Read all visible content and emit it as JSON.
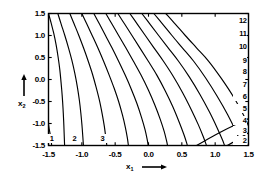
{
  "figure": {
    "background_color": "#ffffff",
    "line_color": "#000000",
    "frame_color": "#000000"
  },
  "axes": {
    "x": {
      "title": "x",
      "title_subscript": "1",
      "title_arrow": "⟶",
      "min": -1.5,
      "max": 1.5,
      "ticks": [
        -1.5,
        -1.0,
        -0.5,
        0.0,
        0.5,
        1.0,
        1.5
      ],
      "tick_labels": [
        "-1.5",
        "-1.0",
        "-0.5",
        "0.0",
        "0.5",
        "1.0",
        "1.5"
      ]
    },
    "y": {
      "title": "x",
      "title_subscript": "2",
      "title_arrow": "↑",
      "min": -1.5,
      "max": 1.5,
      "ticks": [
        -1.5,
        -1.0,
        -0.5,
        0.0,
        0.5,
        1.0,
        1.5
      ],
      "tick_labels": [
        "-1.5",
        "-1.0",
        "-0.5",
        "0.0",
        "0.5",
        "1.0",
        "1.5"
      ]
    }
  },
  "chart_data": {
    "type": "line",
    "plot_kind": "contour",
    "title": "",
    "xlabel": "x1",
    "ylabel": "x2",
    "xlim": [
      -1.5,
      1.5
    ],
    "ylim": [
      -1.5,
      1.5
    ],
    "grid": false,
    "legend": "none",
    "levels": [
      1,
      2,
      3,
      4,
      5,
      6,
      7,
      8,
      9,
      10,
      11,
      12
    ],
    "level_labels_right_edge": [
      "12",
      "11",
      "10",
      "9",
      "8",
      "7",
      "6",
      "5",
      "4",
      "3",
      "2"
    ],
    "level_labels_bottom_edge": [
      "1",
      "2",
      "3"
    ],
    "right_edge_label_y_values": [
      1.32,
      1.04,
      0.74,
      0.43,
      0.16,
      -0.12,
      -0.4,
      -0.68,
      -0.94,
      -1.18,
      -1.4
    ],
    "bottom_edge_label_x_values": [
      -1.46,
      -1.12,
      -0.7
    ],
    "contours": [
      {
        "level": 1,
        "label": "1",
        "points": [
          [
            -1.5,
            -1.02
          ],
          [
            -1.49,
            -1.12
          ],
          [
            -1.475,
            -1.24
          ],
          [
            -1.462,
            -1.36
          ],
          [
            -1.455,
            -1.46
          ],
          [
            -1.452,
            -1.5
          ]
        ]
      },
      {
        "level": 2,
        "label": "2",
        "points": [
          [
            -1.5,
            1.5
          ],
          [
            -1.46,
            1.28
          ],
          [
            -1.42,
            1.04
          ],
          [
            -1.385,
            0.78
          ],
          [
            -1.355,
            0.5
          ],
          [
            -1.33,
            0.22
          ],
          [
            -1.312,
            -0.06
          ],
          [
            -1.295,
            -0.36
          ],
          [
            -1.282,
            -0.66
          ],
          [
            -1.272,
            -0.96
          ],
          [
            -1.265,
            -1.24
          ],
          [
            -1.26,
            -1.44
          ],
          [
            -1.258,
            -1.5
          ]
        ]
      },
      {
        "level": 3,
        "label": "3",
        "points": [
          [
            -1.36,
            1.5
          ],
          [
            -1.31,
            1.26
          ],
          [
            -1.255,
            1.0
          ],
          [
            -1.2,
            0.72
          ],
          [
            -1.15,
            0.44
          ],
          [
            -1.105,
            0.14
          ],
          [
            -1.068,
            -0.16
          ],
          [
            -1.038,
            -0.46
          ],
          [
            -1.015,
            -0.76
          ],
          [
            -0.998,
            -1.04
          ],
          [
            -0.985,
            -1.3
          ],
          [
            -0.978,
            -1.46
          ],
          [
            -0.976,
            -1.5
          ]
        ]
      },
      {
        "level": 4,
        "label": "4",
        "points": [
          [
            -1.18,
            1.5
          ],
          [
            -1.115,
            1.26
          ],
          [
            -1.045,
            1.0
          ],
          [
            -0.975,
            0.72
          ],
          [
            -0.905,
            0.42
          ],
          [
            -0.84,
            0.12
          ],
          [
            -0.785,
            -0.18
          ],
          [
            -0.735,
            -0.48
          ],
          [
            -0.695,
            -0.78
          ],
          [
            -0.663,
            -1.06
          ],
          [
            -0.64,
            -1.32
          ],
          [
            -0.628,
            -1.46
          ],
          [
            -0.625,
            -1.5
          ]
        ]
      },
      {
        "level": 5,
        "label": "5",
        "points": [
          [
            -1.0,
            1.5
          ],
          [
            -0.925,
            1.26
          ],
          [
            -0.845,
            1.0
          ],
          [
            -0.76,
            0.72
          ],
          [
            -0.675,
            0.42
          ],
          [
            -0.59,
            0.1
          ],
          [
            -0.515,
            -0.2
          ],
          [
            -0.448,
            -0.5
          ],
          [
            -0.392,
            -0.8
          ],
          [
            -0.348,
            -1.08
          ],
          [
            -0.318,
            -1.32
          ],
          [
            -0.305,
            -1.46
          ],
          [
            -0.302,
            -1.5
          ]
        ]
      },
      {
        "level": 6,
        "label": "6",
        "points": [
          [
            -0.82,
            1.5
          ],
          [
            -0.735,
            1.26
          ],
          [
            -0.645,
            1.0
          ],
          [
            -0.548,
            0.72
          ],
          [
            -0.45,
            0.42
          ],
          [
            -0.35,
            0.1
          ],
          [
            -0.258,
            -0.22
          ],
          [
            -0.175,
            -0.54
          ],
          [
            -0.105,
            -0.86
          ],
          [
            -0.052,
            -1.14
          ],
          [
            -0.02,
            -1.36
          ],
          [
            -0.008,
            -1.47
          ],
          [
            -0.005,
            -1.5
          ]
        ]
      },
      {
        "level": 7,
        "label": "7",
        "points": [
          [
            -0.64,
            1.5
          ],
          [
            -0.548,
            1.26
          ],
          [
            -0.448,
            1.0
          ],
          [
            -0.34,
            0.72
          ],
          [
            -0.228,
            0.42
          ],
          [
            -0.112,
            0.1
          ],
          [
            -0.002,
            -0.24
          ],
          [
            0.095,
            -0.58
          ],
          [
            0.175,
            -0.9
          ],
          [
            0.235,
            -1.18
          ],
          [
            0.272,
            -1.4
          ],
          [
            0.285,
            -1.5
          ]
        ]
      },
      {
        "level": 8,
        "label": "8",
        "points": [
          [
            -0.46,
            1.5
          ],
          [
            -0.358,
            1.26
          ],
          [
            -0.248,
            1.0
          ],
          [
            -0.13,
            0.72
          ],
          [
            -0.005,
            0.42
          ],
          [
            0.125,
            0.1
          ],
          [
            0.252,
            -0.26
          ],
          [
            0.365,
            -0.62
          ],
          [
            0.458,
            -0.96
          ],
          [
            0.528,
            -1.24
          ],
          [
            0.572,
            -1.44
          ],
          [
            0.582,
            -1.5
          ]
        ]
      },
      {
        "level": 9,
        "label": "9",
        "points": [
          [
            -0.28,
            1.5
          ],
          [
            -0.168,
            1.26
          ],
          [
            -0.048,
            1.0
          ],
          [
            0.082,
            0.72
          ],
          [
            0.222,
            0.42
          ],
          [
            0.368,
            0.08
          ],
          [
            0.512,
            -0.3
          ],
          [
            0.64,
            -0.68
          ],
          [
            0.745,
            -1.02
          ],
          [
            0.822,
            -1.3
          ],
          [
            0.865,
            -1.48
          ],
          [
            0.87,
            -1.5
          ]
        ]
      },
      {
        "level": 10,
        "label": "10",
        "points": [
          [
            -0.1,
            1.5
          ],
          [
            0.022,
            1.26
          ],
          [
            0.152,
            1.0
          ],
          [
            0.295,
            0.72
          ],
          [
            0.448,
            0.42
          ],
          [
            0.612,
            0.06
          ],
          [
            0.772,
            -0.34
          ],
          [
            0.915,
            -0.74
          ],
          [
            1.03,
            -1.1
          ],
          [
            1.112,
            -1.38
          ],
          [
            1.14,
            -1.5
          ]
        ]
      },
      {
        "level": 11,
        "label": "11",
        "points": [
          [
            0.08,
            1.5
          ],
          [
            0.212,
            1.26
          ],
          [
            0.352,
            1.0
          ],
          [
            0.508,
            0.72
          ],
          [
            0.675,
            0.42
          ],
          [
            0.855,
            0.04
          ],
          [
            1.03,
            -0.38
          ],
          [
            1.188,
            -0.8
          ],
          [
            1.312,
            -1.18
          ],
          [
            1.39,
            -1.46
          ],
          [
            1.398,
            -1.5
          ]
        ]
      },
      {
        "level": 12,
        "label": "12",
        "points": [
          [
            0.26,
            1.5
          ],
          [
            0.402,
            1.26
          ],
          [
            0.552,
            1.0
          ],
          [
            0.72,
            0.72
          ],
          [
            0.9,
            0.42
          ],
          [
            1.095,
            0.02
          ],
          [
            1.285,
            -0.42
          ],
          [
            1.45,
            -0.88
          ],
          [
            1.5,
            -1.06
          ]
        ]
      }
    ],
    "corner_contours": [
      {
        "level": 2,
        "label": "2",
        "points": [
          [
            1.18,
            -1.5
          ],
          [
            1.275,
            -1.42
          ],
          [
            1.37,
            -1.33
          ],
          [
            1.46,
            -1.25
          ],
          [
            1.5,
            -1.21
          ]
        ]
      },
      {
        "level": 3,
        "label": "3",
        "points": [
          [
            0.72,
            -1.5
          ],
          [
            0.86,
            -1.38
          ],
          [
            1.0,
            -1.26
          ],
          [
            1.15,
            -1.14
          ],
          [
            1.3,
            -1.03
          ],
          [
            1.44,
            -0.93
          ],
          [
            1.5,
            -0.89
          ]
        ]
      }
    ]
  }
}
